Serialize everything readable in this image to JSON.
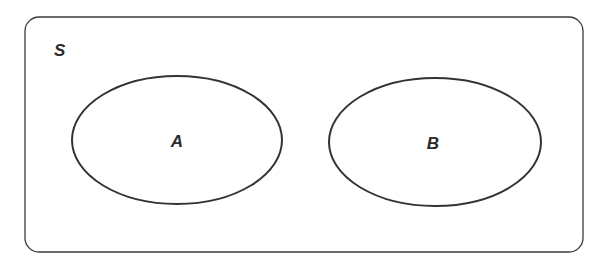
{
  "diagram": {
    "type": "venn",
    "universe": {
      "label": "S"
    },
    "sets": [
      {
        "label": "A"
      },
      {
        "label": "B"
      }
    ],
    "relationship": "disjoint",
    "stroke_color": "#333333"
  }
}
